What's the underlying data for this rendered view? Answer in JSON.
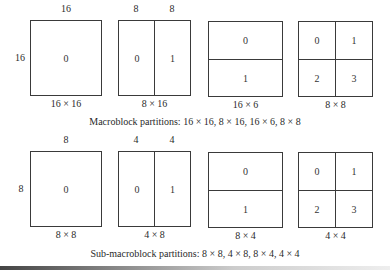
{
  "macroblock": {
    "caption": "Macroblock partitions: 16 × 16, 8 × 16, 16 × 6, 8 × 8",
    "side_label": "16",
    "blocks": [
      {
        "top_labels": [
          "16"
        ],
        "cells": [
          "0"
        ],
        "size_label": "16 × 16"
      },
      {
        "top_labels": [
          "8",
          "8"
        ],
        "cells": [
          "0",
          "1"
        ],
        "size_label": "8 × 16"
      },
      {
        "top_labels": [],
        "cells": [
          "0",
          "1"
        ],
        "size_label": "16 × 6"
      },
      {
        "top_labels": [],
        "cells": [
          "0",
          "1",
          "2",
          "3"
        ],
        "size_label": "8 × 8"
      }
    ]
  },
  "submacroblock": {
    "caption": "Sub-macroblock partitions: 8 × 8, 4 × 8, 8 × 4, 4 × 4",
    "side_label": "8",
    "blocks": [
      {
        "top_labels": [
          "8"
        ],
        "cells": [
          "0"
        ],
        "size_label": "8 × 8"
      },
      {
        "top_labels": [
          "4",
          "4"
        ],
        "cells": [
          "0",
          "1"
        ],
        "size_label": "4 × 8"
      },
      {
        "top_labels": [],
        "cells": [
          "0",
          "1"
        ],
        "size_label": "8 × 4"
      },
      {
        "top_labels": [],
        "cells": [
          "0",
          "1",
          "2",
          "3"
        ],
        "size_label": "4 × 4"
      }
    ]
  }
}
